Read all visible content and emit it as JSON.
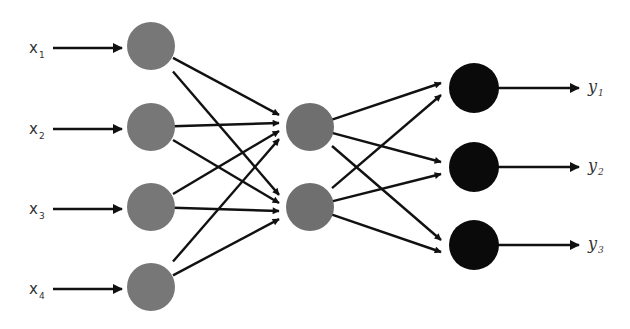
{
  "diagram": {
    "type": "feedforward-neural-network",
    "colors": {
      "input_node": "#777777",
      "hidden_node": "#6f6f6f",
      "output_node": "#0a0a0a",
      "edge": "#111111",
      "label": "#333333"
    },
    "layers": [
      {
        "name": "input",
        "nodes": [
          {
            "id": "i1",
            "label": "x",
            "sub": "1"
          },
          {
            "id": "i2",
            "label": "x",
            "sub": "2"
          },
          {
            "id": "i3",
            "label": "x",
            "sub": "3"
          },
          {
            "id": "i4",
            "label": "x",
            "sub": "4"
          }
        ]
      },
      {
        "name": "hidden",
        "nodes": [
          {
            "id": "h1"
          },
          {
            "id": "h2"
          }
        ]
      },
      {
        "name": "output",
        "nodes": [
          {
            "id": "o1",
            "label": "y",
            "sub": "1"
          },
          {
            "id": "o2",
            "label": "y",
            "sub": "2"
          },
          {
            "id": "o3",
            "label": "y",
            "sub": "3"
          }
        ]
      }
    ],
    "connections": "fully-connected between adjacent layers; arrows point forward"
  }
}
